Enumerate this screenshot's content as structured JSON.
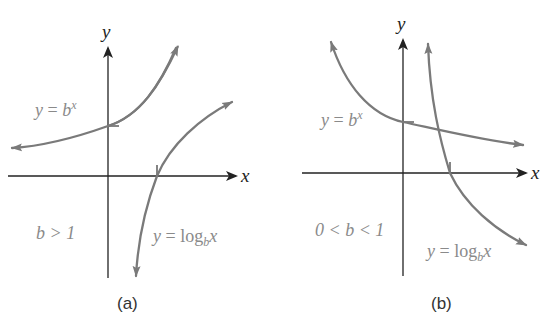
{
  "figure": {
    "panels": [
      {
        "id": "a",
        "caption": "(a)",
        "axis_x_label": "x",
        "axis_y_label": "y",
        "exp_label": {
          "lhs": "y",
          "eq": "=",
          "base": "b",
          "exponent": "x"
        },
        "log_label": {
          "lhs": "y",
          "eq": "=",
          "func": "log",
          "base": "b",
          "arg": "x"
        },
        "condition": "b > 1"
      },
      {
        "id": "b",
        "caption": "(b)",
        "axis_x_label": "x",
        "axis_y_label": "y",
        "exp_label": {
          "lhs": "y",
          "eq": "=",
          "base": "b",
          "exponent": "x"
        },
        "log_label": {
          "lhs": "y",
          "eq": "=",
          "func": "log",
          "base": "b",
          "arg": "x"
        },
        "condition": "0 < b < 1"
      }
    ],
    "colors": {
      "curve": "#7a7a7a",
      "axis": "#222222",
      "label": "#8a8a8a"
    }
  }
}
